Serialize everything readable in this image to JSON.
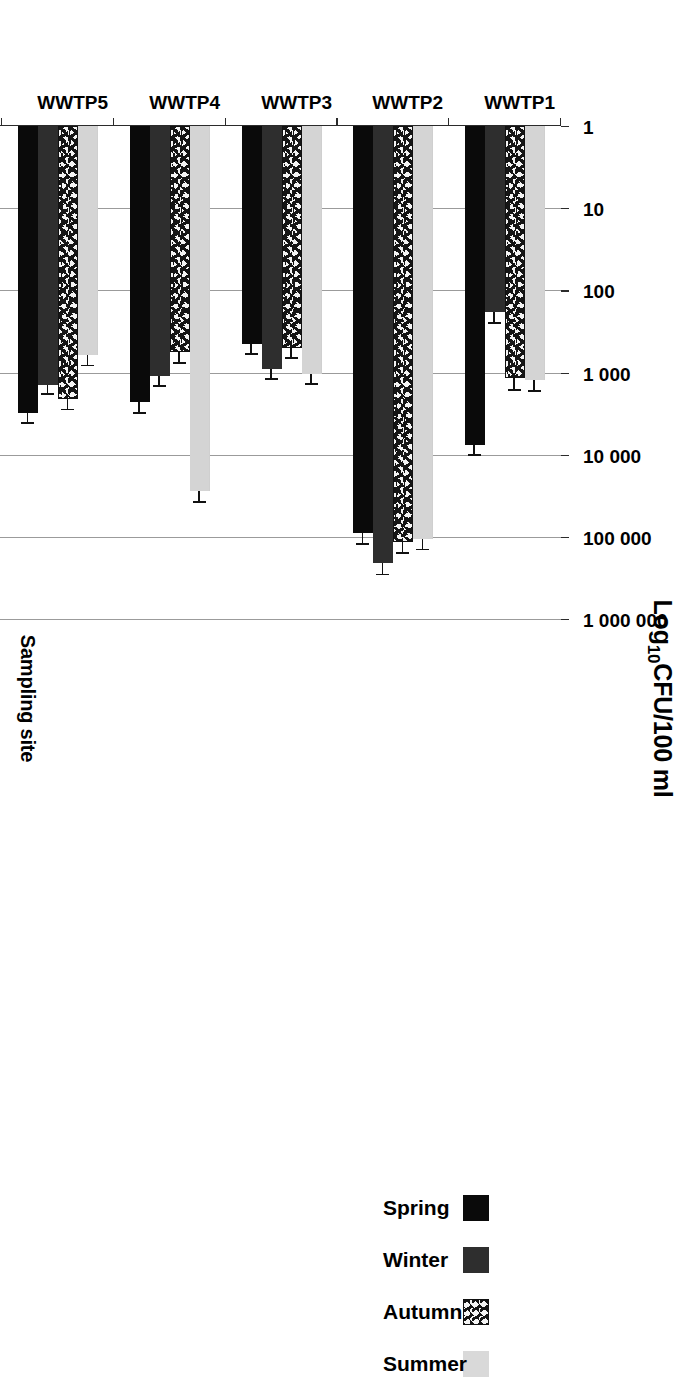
{
  "chart_data": {
    "type": "bar",
    "orientation": "horizontal",
    "title": "",
    "xlabel": "Log10CFU/100 ml",
    "xlabel_parts": {
      "pre": "Log",
      "sub": "10",
      "post": "CFU/100 ml"
    },
    "ylabel": "Sampling site",
    "categories": [
      "WWTP1",
      "WWTP2",
      "WWTP3",
      "WWTP4",
      "WWTP5",
      "WWTP6",
      "WWTP7"
    ],
    "scale": "log10",
    "xlim": [
      1,
      1000000
    ],
    "xticks": [
      1,
      10,
      100,
      1000,
      10000,
      100000,
      1000000
    ],
    "xticklabels": [
      "1",
      "10",
      "100",
      "1 000",
      "10 000",
      "100 000",
      "1 000 000"
    ],
    "grid": "vertical",
    "legend_position": "bottom",
    "legend": [
      "Summer",
      "Autumn",
      "Winter",
      "Spring"
    ],
    "series": [
      {
        "name": "Spring",
        "fill": "solid-black",
        "color": "#0a0a0a",
        "values": [
          7600,
          90000,
          450,
          2300,
          3100,
          3000,
          560
        ],
        "errors": [
          2200,
          30000,
          130,
          700,
          900,
          850,
          150
        ]
      },
      {
        "name": "Winter",
        "fill": "solid-dark-grey",
        "color": "#2e2e2e",
        "values": [
          185,
          210000,
          900,
          1100,
          1400,
          1600,
          300
        ],
        "errors": [
          60,
          70000,
          260,
          330,
          400,
          450,
          90
        ]
      },
      {
        "name": "Autumn",
        "fill": "speckled-pattern",
        "color": "#f4f4f4",
        "values": [
          1180,
          115000,
          500,
          570,
          2100,
          1900,
          1050
        ],
        "errors": [
          420,
          38000,
          150,
          170,
          650,
          580,
          320
        ]
      },
      {
        "name": "Summer",
        "fill": "solid-light-grey",
        "color": "#d4d4d4",
        "values": [
          1250,
          105000,
          1050,
          28000,
          620,
          26000,
          1080
        ],
        "errors": [
          380,
          34000,
          300,
          9000,
          180,
          8000,
          320
        ]
      }
    ]
  },
  "axis": {
    "value_axis_title": "Log10CFU/100 ml",
    "value_axis_title_pre": "Log",
    "value_axis_title_sub": "10",
    "value_axis_title_post": "CFU/100 ml",
    "category_axis_title": "Sampling site"
  }
}
